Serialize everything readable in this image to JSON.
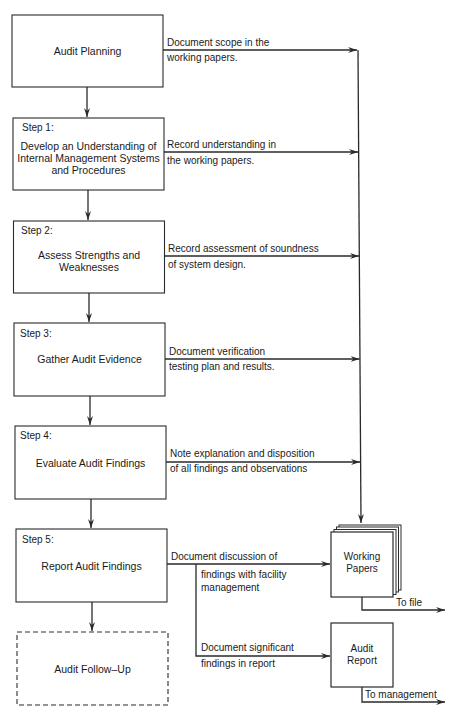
{
  "colors": {
    "stroke": "#2a2a2a",
    "background": "#ffffff",
    "text": "#1a1a1a"
  },
  "process_boxes": [
    {
      "id": "audit-planning",
      "step_label": "",
      "title": "Audit Planning",
      "note_line1": "Document scope in the",
      "note_line2": "working papers."
    },
    {
      "id": "step-1",
      "step_label": "Step 1:",
      "title_lines": [
        "Develop an Understanding of",
        "Internal Management Systems",
        "and Procedures"
      ],
      "note_line1": "Record understanding in",
      "note_line2": "the working papers."
    },
    {
      "id": "step-2",
      "step_label": "Step 2:",
      "title_lines": [
        "Assess Strengths and",
        "Weaknesses"
      ],
      "note_line1": "Record assessment of soundness",
      "note_line2": "of system design."
    },
    {
      "id": "step-3",
      "step_label": "Step 3:",
      "title": "Gather Audit Evidence",
      "note_line1": "Document verification",
      "note_line2": "testing plan and results."
    },
    {
      "id": "step-4",
      "step_label": "Step 4:",
      "title": "Evaluate Audit Findings",
      "note_line1": "Note explanation and disposition",
      "note_line2": "of all findings and observations"
    },
    {
      "id": "step-5",
      "step_label": "Step 5:",
      "title": "Report Audit Findings",
      "note_line1": "Document discussion of",
      "note_line2": "findings with facility",
      "note_line3": "management",
      "branch_line1": "Document significant",
      "branch_line2": "findings in report"
    }
  ],
  "follow_up": {
    "title": "Audit Follow–Up",
    "style": "dashed"
  },
  "working_papers": {
    "title_line1": "Working",
    "title_line2": "Papers",
    "output_label": "To file"
  },
  "audit_report": {
    "title_line1": "Audit",
    "title_line2": "Report",
    "output_label": "To management"
  }
}
